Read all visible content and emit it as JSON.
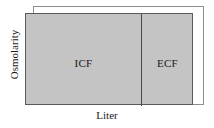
{
  "figure": {
    "kind": "darrow-yannet-diagram",
    "background_color": "#ffffff"
  },
  "axes": {
    "y_label": "Osmolarity",
    "x_label": "Liter"
  },
  "compartments": [
    {
      "key": "icf",
      "label": "ICF",
      "fill_color": "#c4c4c4",
      "border_color": "#5a5a5a"
    },
    {
      "key": "ecf",
      "label": "ECF",
      "fill_color": "#c4c4c4",
      "border_color": "#5a5a5a"
    }
  ],
  "overlay": {
    "name": "shifted-state-outline",
    "border_color": "#8d8d8d",
    "fill": "none"
  },
  "divider": {
    "color": "#4a4a4a"
  },
  "chart_data": {
    "type": "bar",
    "title": "",
    "xlabel": "Liter",
    "ylabel": "Osmolarity",
    "categories": [
      "ICF",
      "ECF"
    ],
    "values": [
      1,
      1
    ],
    "widths": [
      115,
      52
    ],
    "grid": false,
    "legend": false,
    "series": [
      {
        "name": "baseline",
        "values": [
          1,
          1
        ],
        "widths": [
          115,
          52
        ],
        "fill": "#c4c4c4"
      },
      {
        "name": "shifted",
        "values": [
          1.08,
          1.08
        ],
        "widths": [
          117,
          54
        ],
        "fill": "none"
      }
    ]
  }
}
